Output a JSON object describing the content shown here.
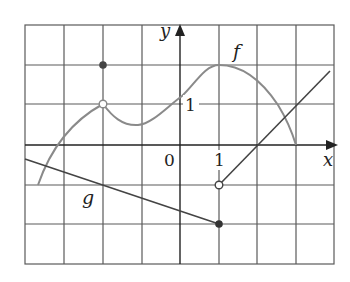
{
  "figure": {
    "type": "function-graph",
    "grid": {
      "x_min": -4,
      "x_max": 4,
      "y_min": -3,
      "y_max": 3,
      "origin_px": [
        180,
        145
      ],
      "unit_px": [
        38.65,
        39.8
      ],
      "line_color": "#555555",
      "border_color": "#555555"
    },
    "axes": {
      "x_label": "x",
      "y_label": "y",
      "origin_label": "0",
      "x_tick_label": "1",
      "y_tick_label": "1",
      "color": "#222222"
    },
    "curves": [
      {
        "name": "f",
        "label": "f",
        "color": "#888888",
        "description": "curve from (-3.65,-1) rising to open circle at (-2,1), dipping to min near (-1.15,0.5), rising to max (1,2), falling to (3,0)"
      },
      {
        "name": "g",
        "label": "g",
        "color": "#444444",
        "description": "line from (-4,-0.35) to filled point (1,-2)"
      },
      {
        "name": "right-line",
        "color": "#444444",
        "description": "line from open point (1,-1) with slope 1 to (3.8,1.9)"
      }
    ],
    "points": [
      {
        "name": "f-filled-point",
        "x": -2,
        "y": 2,
        "style": "filled"
      },
      {
        "name": "f-open-point",
        "x": -2,
        "y": 1,
        "style": "open"
      },
      {
        "name": "g-filled-point",
        "x": 1,
        "y": -2,
        "style": "filled"
      },
      {
        "name": "line-open-point",
        "x": 1,
        "y": -1,
        "style": "open"
      }
    ]
  }
}
